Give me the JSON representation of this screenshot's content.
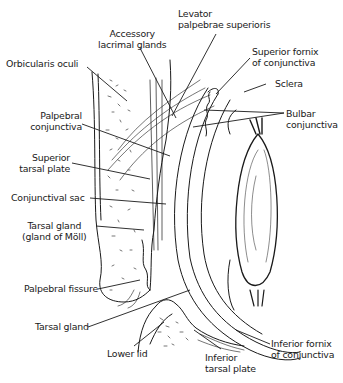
{
  "diagram": {
    "labels": {
      "accessory_lacrimal": [
        "Accessory",
        "lacrimal glands"
      ],
      "levator": [
        "Levator",
        "palpebrae superioris"
      ],
      "orbicularis": [
        "Orbicularis oculi"
      ],
      "superior_fornix": [
        "Superior fornix",
        "of conjunctiva"
      ],
      "sclera": [
        "Sclera"
      ],
      "palpebral_conj": [
        "Palpebral",
        "conjunctiva"
      ],
      "bulbar_conj": [
        "Bulbar",
        "conjunctiva"
      ],
      "superior_tarsal": [
        "Superior",
        "tarsal plate"
      ],
      "conj_sac": [
        "Conjunctival sac"
      ],
      "tarsal_gland_moll": [
        "Tarsal gland",
        "(gland of Möll)"
      ],
      "palpebral_fissure": [
        "Palpebral fissure"
      ],
      "tarsal_gland": [
        "Tarsal gland"
      ],
      "lower_lid": [
        "Lower lid"
      ],
      "inferior_tarsal": [
        "Inferior",
        "tarsal plate"
      ],
      "inferior_fornix": [
        "Inferior fornix",
        "of conjunctiva"
      ]
    },
    "colors": {
      "ink": "#1a1a1a",
      "background": "#ffffff",
      "accent": "#2a2a7a"
    }
  }
}
